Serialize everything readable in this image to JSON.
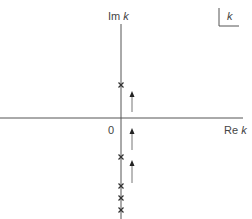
{
  "diagram": {
    "type": "complex-k-plane",
    "axes": {
      "imaginary_label": "Im",
      "real_label": "Re",
      "variable": "k",
      "origin_label": "0"
    },
    "corner_label": "k",
    "poles_y": [
      85,
      157,
      186,
      198,
      210
    ],
    "arrows": [
      {
        "x": 132,
        "from_y": 112,
        "to_y": 92
      },
      {
        "x": 132,
        "from_y": 150,
        "to_y": 129
      },
      {
        "x": 132,
        "from_y": 183,
        "to_y": 161
      }
    ],
    "colors": {
      "line": "#555555",
      "arrow": "#777777"
    }
  }
}
